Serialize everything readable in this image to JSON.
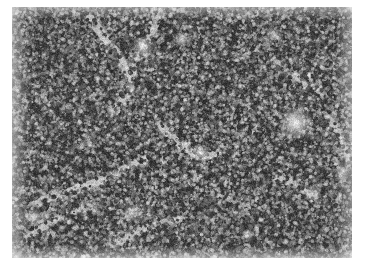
{
  "page": {
    "background_color": "#ffffff",
    "width": 365,
    "height": 273
  },
  "figure": {
    "type": "photomicrograph",
    "modality": "light-microscopy",
    "stain": "hematoxylin-and-eosin",
    "color_mode": "grayscale",
    "caption": "",
    "label": "",
    "scale_bar_text": "",
    "magnification_text": ""
  },
  "micrograph": {
    "name": "histology-micrograph",
    "x": 12,
    "y": 7,
    "width": 340,
    "height": 251,
    "description": "Densely packed small dark-staining lymphoid nuclei filling the entire field, interrupted by pale branching sinusoidal and vascular channels and scattered lighter cells.",
    "tone": {
      "background_gray": "#8d8d8d",
      "nuclei_dark": "#2a2a2a",
      "nuclei_mid": "#555555",
      "cytoplasm_light": "#c8c8c8",
      "lumen_white": "#f2f2f2"
    },
    "texture": {
      "nucleus_count": 22000,
      "nucleus_radius_px_min": 1.0,
      "nucleus_radius_px_max": 2.6,
      "density": "high",
      "seed": 20240517
    },
    "pale_channels": [
      {
        "name": "vessel-upper-left",
        "points": [
          [
            78,
            12
          ],
          [
            96,
            34
          ],
          [
            112,
            58
          ],
          [
            118,
            84
          ],
          [
            104,
            104
          ]
        ],
        "width": 9,
        "opacity": 0.55
      },
      {
        "name": "sinusoid-upper-mid",
        "points": [
          [
            150,
            4
          ],
          [
            140,
            26
          ],
          [
            126,
            48
          ],
          [
            120,
            70
          ]
        ],
        "width": 7,
        "opacity": 0.48
      },
      {
        "name": "sinusoid-mid-center",
        "points": [
          [
            150,
            120
          ],
          [
            170,
            140
          ],
          [
            188,
            150
          ],
          [
            206,
            146
          ]
        ],
        "width": 8,
        "opacity": 0.5
      },
      {
        "name": "sinusoid-mid-left",
        "points": [
          [
            24,
            196
          ],
          [
            52,
            186
          ],
          [
            84,
            176
          ],
          [
            110,
            164
          ],
          [
            132,
            152
          ]
        ],
        "width": 8,
        "opacity": 0.52
      },
      {
        "name": "sinusoid-lower-left",
        "points": [
          [
            14,
            232
          ],
          [
            34,
            218
          ],
          [
            56,
            206
          ],
          [
            78,
            200
          ]
        ],
        "width": 7,
        "opacity": 0.5
      },
      {
        "name": "sinusoid-lower-mid",
        "points": [
          [
            100,
            238
          ],
          [
            124,
            226
          ],
          [
            146,
            216
          ],
          [
            168,
            212
          ]
        ],
        "width": 7,
        "opacity": 0.46
      },
      {
        "name": "sinusoid-right-upper",
        "points": [
          [
            262,
            52
          ],
          [
            280,
            66
          ],
          [
            296,
            78
          ],
          [
            310,
            86
          ]
        ],
        "width": 6,
        "opacity": 0.44
      },
      {
        "name": "sinusoid-right-lower",
        "points": [
          [
            268,
            170
          ],
          [
            288,
            180
          ],
          [
            306,
            190
          ],
          [
            326,
            194
          ]
        ],
        "width": 7,
        "opacity": 0.48
      },
      {
        "name": "sinusoid-far-right",
        "points": [
          [
            316,
            110
          ],
          [
            330,
            130
          ],
          [
            336,
            152
          ]
        ],
        "width": 6,
        "opacity": 0.42
      },
      {
        "name": "sinusoid-center-low",
        "points": [
          [
            196,
            180
          ],
          [
            216,
            192
          ],
          [
            236,
            200
          ]
        ],
        "width": 6,
        "opacity": 0.4
      }
    ],
    "bright_foci": [
      {
        "name": "vessel-lumen-right",
        "cx": 284,
        "cy": 116,
        "r": 7.5,
        "brightness": 0.95
      },
      {
        "name": "vessel-lumen-top-mid",
        "cx": 131,
        "cy": 40,
        "r": 5.0,
        "brightness": 0.82
      },
      {
        "name": "vessel-lumen-top-right",
        "cx": 170,
        "cy": 32,
        "r": 3.6,
        "brightness": 0.76
      },
      {
        "name": "vessel-lumen-upper-right",
        "cx": 262,
        "cy": 28,
        "r": 3.2,
        "brightness": 0.72
      },
      {
        "name": "vessel-lumen-lower-left",
        "cx": 22,
        "cy": 210,
        "r": 4.4,
        "brightness": 0.8
      },
      {
        "name": "vessel-lumen-lower-mid",
        "cx": 120,
        "cy": 206,
        "r": 4.0,
        "brightness": 0.78
      },
      {
        "name": "vessel-lumen-center",
        "cx": 188,
        "cy": 146,
        "r": 4.2,
        "brightness": 0.74
      },
      {
        "name": "vessel-lumen-far-right",
        "cx": 330,
        "cy": 166,
        "r": 3.4,
        "brightness": 0.7
      },
      {
        "name": "vessel-lumen-mid-right",
        "cx": 300,
        "cy": 186,
        "r": 3.8,
        "brightness": 0.72
      },
      {
        "name": "vessel-lumen-bottom",
        "cx": 236,
        "cy": 228,
        "r": 3.0,
        "brightness": 0.68
      }
    ],
    "illumination": {
      "center_bias": 0.1,
      "corner_falloff": 0.22
    }
  }
}
